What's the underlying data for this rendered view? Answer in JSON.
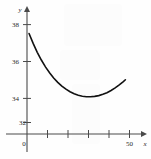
{
  "chart_data": {
    "type": "line",
    "title": "",
    "subtitle": "",
    "xlabel": "x",
    "ylabel": "y",
    "xlim": [
      0,
      60
    ],
    "ylim": [
      31.6,
      38.9
    ],
    "grid": false,
    "legend": null,
    "x_ticks": [
      0,
      10,
      20,
      30,
      40,
      50
    ],
    "x_tick_labels": [
      "",
      "",
      "",
      "",
      "",
      "50"
    ],
    "y_ticks": [
      32,
      34,
      36,
      38
    ],
    "y_tick_labels": [
      "32",
      "34",
      "36",
      "38"
    ],
    "origin_label": "0",
    "annotations": [],
    "series": [
      {
        "name": "curve",
        "color": "#111111",
        "x": [
          1,
          3,
          5,
          7,
          9,
          11,
          13,
          15,
          17,
          19,
          21,
          23,
          25,
          27,
          29,
          31,
          33,
          35,
          37,
          39,
          41,
          43,
          45,
          47,
          48
        ],
        "y": [
          37.52,
          36.98,
          36.5,
          36.08,
          35.71,
          35.39,
          35.11,
          34.87,
          34.67,
          34.5,
          34.36,
          34.25,
          34.17,
          34.12,
          34.09,
          34.09,
          34.11,
          34.15,
          34.22,
          34.31,
          34.43,
          34.57,
          34.73,
          34.91,
          35.01
        ]
      }
    ]
  },
  "axes": {
    "y_axis_name": "y",
    "x_axis_name": "x"
  },
  "colors": {
    "curve": "#111111",
    "axis": "#4a4a4a",
    "text": "#2a2a2a",
    "background": "#fefefe"
  }
}
